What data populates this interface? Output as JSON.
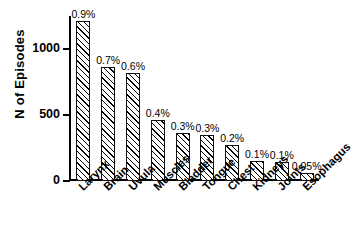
{
  "chart_data": {
    "type": "bar",
    "title": "",
    "subtitle": "",
    "xlabel": "",
    "ylabel": "N of Episodes",
    "ylim": [
      0,
      1250
    ],
    "grid": false,
    "legend": null,
    "ytick_labels": [
      "0",
      "500",
      "1000"
    ],
    "ytick_values": [
      0,
      500,
      1000
    ],
    "categories": [
      "Larynx",
      "Brain",
      "Uvula",
      "Muscles",
      "Bladder",
      "Tongue",
      "Chest",
      "Kidneys",
      "Joints",
      "Esophagus"
    ],
    "values": [
      1210,
      860,
      820,
      460,
      360,
      350,
      270,
      155,
      147,
      62
    ],
    "annotations": [
      "0.9%",
      "0.7%",
      "0.6%",
      "0.4%",
      "0.3%",
      "0.3%",
      "0.2%",
      "0.1%",
      "0.1%",
      "0.05%"
    ],
    "bar_style": {
      "fill": "#ffffff",
      "hatch": "/",
      "edge_color": "#111111"
    }
  }
}
